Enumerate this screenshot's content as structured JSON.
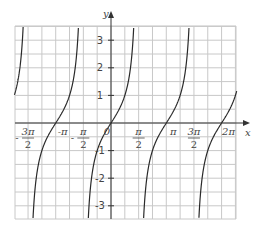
{
  "chart_data": {
    "type": "line",
    "title": "",
    "function": "y = tan(x)",
    "xlabel": "x",
    "ylabel": "y",
    "xlim": [
      -5.49,
      7.14
    ],
    "ylim": [
      -3.5,
      3.5
    ],
    "grid": true,
    "grid_x_step": 0.7854,
    "grid_y_step": 0.5,
    "x_ticks": [
      {
        "value": -4.7124,
        "label_num": "3π",
        "label_den": "2",
        "sign": "-"
      },
      {
        "value": -3.1416,
        "label": "-π"
      },
      {
        "value": -1.5708,
        "label_num": "π",
        "label_den": "2",
        "sign": "-"
      },
      {
        "value": 0,
        "label": "0"
      },
      {
        "value": 1.5708,
        "label_num": "π",
        "label_den": "2",
        "sign": ""
      },
      {
        "value": 3.1416,
        "label": "π"
      },
      {
        "value": 4.7124,
        "label_num": "3π",
        "label_den": "2",
        "sign": ""
      },
      {
        "value": 6.2832,
        "label": "2π"
      }
    ],
    "y_ticks": [
      {
        "value": 3,
        "label": "3"
      },
      {
        "value": 2,
        "label": "2"
      },
      {
        "value": 1,
        "label": "1"
      },
      {
        "value": -1,
        "label": "-1"
      },
      {
        "value": -2,
        "label": "-2"
      },
      {
        "value": -3,
        "label": "-3"
      }
    ],
    "zeros": [
      -3.1416,
      0,
      3.1416,
      6.2832
    ],
    "asymptotes": [
      -4.7124,
      -1.5708,
      1.5708,
      4.7124
    ],
    "series": [
      {
        "name": "tan(x)",
        "color": "#2a2a2a"
      }
    ],
    "legend": null
  },
  "layout": {
    "origin_px": [
      111,
      123
    ],
    "px_per_rad": 17.6,
    "px_per_unit_y": 27.6,
    "plot_box_px": [
      15,
      26,
      236,
      219
    ]
  }
}
